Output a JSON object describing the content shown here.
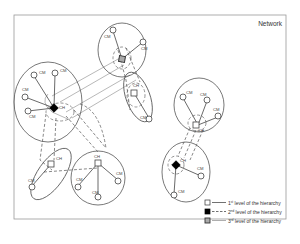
{
  "title": "Network",
  "labels": {
    "cluster_member": "CM",
    "cluster_head": "CH"
  },
  "legend": [
    {
      "symbol": "white-square",
      "line": "solid",
      "text": "1st level of the hierarchy",
      "ordinal": "1",
      "suffix": "st",
      "rest": " level of the hierarchy"
    },
    {
      "symbol": "black-square",
      "line": "dashed",
      "text": "2nd level of the hierarchy",
      "ordinal": "2",
      "suffix": "nd",
      "rest": " level of the hierarchy"
    },
    {
      "symbol": "gray-square",
      "line": "solid-light",
      "text": "3rd level of the hierarchy",
      "ordinal": "3",
      "suffix": "rd",
      "rest": " level of the hierarchy"
    }
  ],
  "colors": {
    "level1": "#ffffff",
    "level2": "#000000",
    "level3": "#aaaaaa"
  }
}
